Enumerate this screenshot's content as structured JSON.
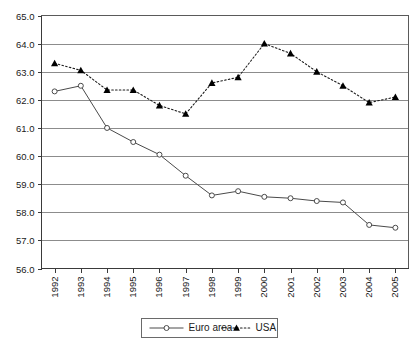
{
  "chart_data": {
    "type": "line",
    "title": "",
    "subtitle": "",
    "xlabel": "",
    "ylabel": "",
    "categories": [
      "1992",
      "1993",
      "1994",
      "1995",
      "1996",
      "1997",
      "1998",
      "1999",
      "2000",
      "2001",
      "2002",
      "2003",
      "2004",
      "2005"
    ],
    "ylim": [
      56.0,
      65.0
    ],
    "ytick_labels": [
      "65.0",
      "64.0",
      "63.0",
      "62.0",
      "61.0",
      "60.0",
      "59.0",
      "58.0",
      "57.0",
      "56.0"
    ],
    "ytick_values": [
      65.0,
      64.0,
      63.0,
      62.0,
      61.0,
      60.0,
      59.0,
      58.0,
      57.0,
      56.0
    ],
    "grid": true,
    "legend_position": "bottom",
    "series": [
      {
        "name": "Euro area",
        "marker": "open-circle",
        "line_style": "solid",
        "color": "#4a4a4a",
        "values": [
          62.3,
          62.5,
          61.0,
          60.5,
          60.05,
          59.3,
          58.6,
          58.75,
          58.55,
          58.5,
          58.4,
          58.35,
          57.55,
          57.45
        ]
      },
      {
        "name": "USA",
        "marker": "filled-triangle",
        "line_style": "dotted",
        "color": "#000000",
        "values": [
          63.3,
          63.05,
          62.35,
          62.35,
          61.8,
          61.5,
          62.6,
          62.8,
          64.0,
          63.65,
          63.0,
          62.5,
          61.9,
          62.1
        ]
      }
    ]
  },
  "legend": {
    "items": [
      {
        "label": "Euro area"
      },
      {
        "label": "USA"
      }
    ]
  }
}
